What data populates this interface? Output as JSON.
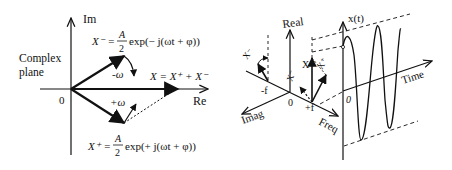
{
  "left_diagram": {
    "title": "Complex plane",
    "title_line1": "Complex",
    "title_line2": "plane",
    "axis_im": "Im",
    "axis_re": "Re",
    "origin": "0",
    "neg_omega": "-ω",
    "pos_omega": "+ω",
    "sum_label": "X = X⁺ + X⁻",
    "xminus_lhs": "X⁻ =",
    "xminus_frac_num": "A",
    "xminus_frac_den": "2",
    "xminus_rhs": "exp(− j(ωt + φ))",
    "xplus_lhs": "X⁺ =",
    "xplus_frac_num": "A",
    "xplus_frac_den": "2",
    "xplus_rhs": "exp(+ j(ωt + φ))"
  },
  "right_diagram": {
    "axis_real": "Real",
    "axis_imag": "Imag",
    "axis_freq": "Freq",
    "axis_time": "Time",
    "axis_xt": "x(t)",
    "origin": "0",
    "time_origin": "0",
    "neg_f": "-f",
    "pos_f": "+f",
    "label_x": "X",
    "label_xminus_left": "X⁻",
    "label_xminus": "X⁻",
    "label_xplus": "X⁺"
  }
}
